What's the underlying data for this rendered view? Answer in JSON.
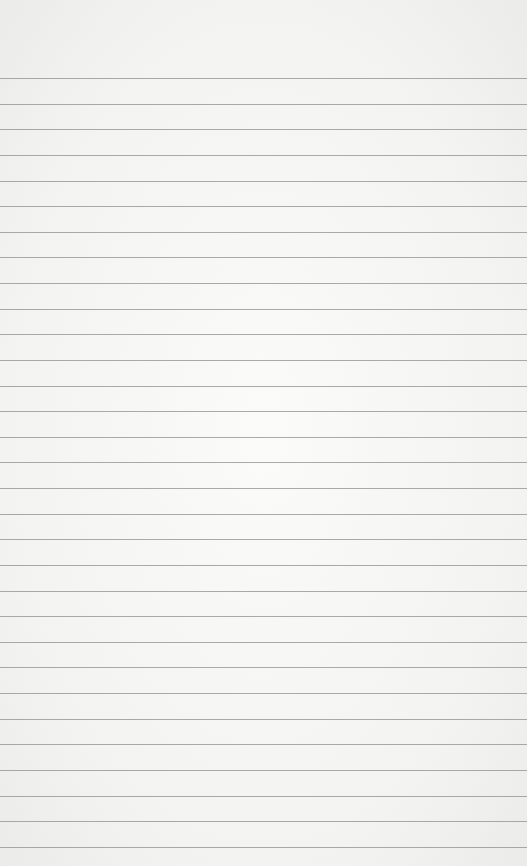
{
  "page": {
    "type": "lined-paper",
    "background": "#f4f4f2",
    "line_color": "#8f8f8f"
  },
  "lines": {
    "first_y": 78,
    "spacing": 25.63,
    "count": 31
  }
}
